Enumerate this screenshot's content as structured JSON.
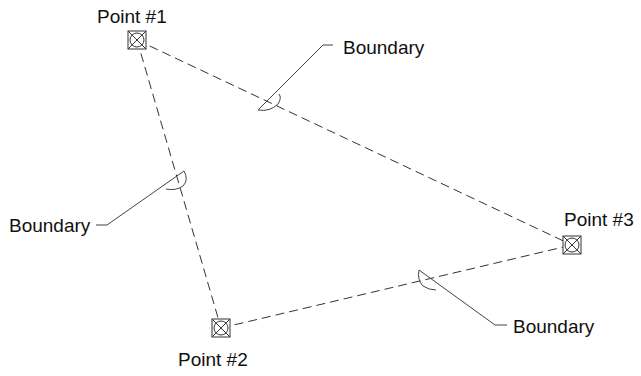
{
  "diagram": {
    "type": "survey-boundary-triangle",
    "points": [
      {
        "id": "p1",
        "label": "Point #1",
        "x": 137,
        "y": 40,
        "label_x": 97,
        "label_y": 23
      },
      {
        "id": "p2",
        "label": "Point #2",
        "x": 221,
        "y": 328,
        "label_x": 178,
        "label_y": 366
      },
      {
        "id": "p3",
        "label": "Point #3",
        "x": 572,
        "y": 245,
        "label_x": 564,
        "label_y": 226
      }
    ],
    "edges": [
      {
        "from": "p1",
        "to": "p3",
        "style": "dashed"
      },
      {
        "from": "p1",
        "to": "p2",
        "style": "dashed"
      },
      {
        "from": "p2",
        "to": "p3",
        "style": "dashed"
      }
    ],
    "callouts": [
      {
        "id": "top",
        "label": "Boundary",
        "edge": "p1-p3",
        "text_x": 343,
        "text_y": 54
      },
      {
        "id": "left",
        "label": "Boundary",
        "edge": "p1-p2",
        "text_x": 9,
        "text_y": 232
      },
      {
        "id": "bottom",
        "label": "Boundary",
        "edge": "p2-p3",
        "text_x": 513,
        "text_y": 333
      }
    ],
    "marker_symbol": "square-with-x-and-circle",
    "colors": {
      "line": "#333333",
      "text": "#111111",
      "background": "#ffffff"
    }
  }
}
